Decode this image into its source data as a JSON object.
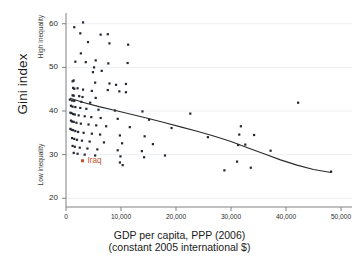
{
  "chart_data": {
    "type": "scatter",
    "title": "",
    "xlabel": "GDP per capita, PPP (2006)",
    "xlabel_line2": "(constant 2005 international $)",
    "ylabel": "Gini index",
    "xlim": [
      0,
      52000
    ],
    "ylim": [
      18,
      62
    ],
    "xticks": [
      0,
      10000,
      20000,
      30000,
      40000,
      50000
    ],
    "xtick_labels": [
      "0",
      "10,000",
      "20,000",
      "30,000",
      "40,000",
      "50,000"
    ],
    "yticks": [
      20,
      30,
      40,
      50,
      60
    ],
    "ytick_labels": [
      "20",
      "30",
      "40",
      "50",
      "60"
    ],
    "grid": "horizontal-faint",
    "legend": "none",
    "annotations": [
      {
        "text": "High inequality",
        "axis": "y",
        "position": "upper",
        "rotation": -90
      },
      {
        "text": "Low inequality",
        "axis": "y",
        "position": "lower",
        "rotation": -90
      }
    ],
    "colors": {
      "point": "#22262e",
      "highlight": "#c0542c",
      "trendline": "#2a2a2a",
      "grid": "#eceff2",
      "axis": "#808080",
      "background": "#ffffff"
    },
    "series": [
      {
        "name": "Countries",
        "marker": "square",
        "color": "#22262e",
        "points": [
          [
            1500,
            59.2
          ],
          [
            3100,
            60.3
          ],
          [
            2600,
            57.8
          ],
          [
            6300,
            57.5
          ],
          [
            4000,
            55.8
          ],
          [
            7600,
            57.6
          ],
          [
            7900,
            55.5
          ],
          [
            11300,
            55.2
          ],
          [
            2700,
            53.2
          ],
          [
            1700,
            51.3
          ],
          [
            3600,
            51.2
          ],
          [
            5400,
            51.6
          ],
          [
            5100,
            50.0
          ],
          [
            6500,
            49.2
          ],
          [
            4900,
            48.9
          ],
          [
            11200,
            51.0
          ],
          [
            7700,
            50.9
          ],
          [
            1400,
            47.0
          ],
          [
            1200,
            46.8
          ],
          [
            5300,
            46.5
          ],
          [
            7900,
            46.3
          ],
          [
            9100,
            46.0
          ],
          [
            10900,
            46.2
          ],
          [
            1300,
            45.3
          ],
          [
            1500,
            45.1
          ],
          [
            2100,
            45.2
          ],
          [
            3100,
            44.9
          ],
          [
            4700,
            44.6
          ],
          [
            7600,
            44.8
          ],
          [
            9700,
            44.5
          ],
          [
            10900,
            44.3
          ],
          [
            1200,
            43.6
          ],
          [
            1400,
            43.5
          ],
          [
            2400,
            43.4
          ],
          [
            3000,
            43.2
          ],
          [
            5400,
            43.0
          ],
          [
            700,
            42.6
          ],
          [
            1100,
            42.4
          ],
          [
            1500,
            42.3
          ],
          [
            2800,
            42.1
          ],
          [
            4400,
            41.9
          ],
          [
            900,
            41.2
          ],
          [
            1200,
            41.0
          ],
          [
            1700,
            40.9
          ],
          [
            2600,
            40.7
          ],
          [
            3700,
            40.5
          ],
          [
            5900,
            40.3
          ],
          [
            8900,
            40.1
          ],
          [
            13900,
            39.9
          ],
          [
            22600,
            39.4
          ],
          [
            800,
            39.6
          ],
          [
            1000,
            39.5
          ],
          [
            1300,
            39.3
          ],
          [
            1600,
            39.2
          ],
          [
            2300,
            39.0
          ],
          [
            3400,
            38.8
          ],
          [
            4600,
            38.6
          ],
          [
            6300,
            38.4
          ],
          [
            9400,
            38.2
          ],
          [
            15100,
            38.0
          ],
          [
            900,
            37.8
          ],
          [
            1100,
            37.6
          ],
          [
            1400,
            37.5
          ],
          [
            1900,
            37.3
          ],
          [
            2700,
            37.1
          ],
          [
            4100,
            36.9
          ],
          [
            5500,
            36.7
          ],
          [
            7300,
            36.5
          ],
          [
            11600,
            36.3
          ],
          [
            19200,
            36.1
          ],
          [
            31800,
            36.5
          ],
          [
            800,
            35.9
          ],
          [
            1000,
            35.7
          ],
          [
            1300,
            35.6
          ],
          [
            1700,
            35.4
          ],
          [
            2200,
            35.2
          ],
          [
            3200,
            35.0
          ],
          [
            4700,
            34.8
          ],
          [
            6200,
            34.6
          ],
          [
            9800,
            34.4
          ],
          [
            14300,
            34.2
          ],
          [
            25800,
            34.0
          ],
          [
            31500,
            34.6
          ],
          [
            34200,
            34.5
          ],
          [
            1100,
            33.8
          ],
          [
            1500,
            33.6
          ],
          [
            2000,
            33.4
          ],
          [
            2900,
            33.2
          ],
          [
            4300,
            33.0
          ],
          [
            6900,
            32.8
          ],
          [
            10200,
            32.6
          ],
          [
            15800,
            32.4
          ],
          [
            32600,
            32.3
          ],
          [
            1200,
            32.0
          ],
          [
            1600,
            31.8
          ],
          [
            2500,
            31.6
          ],
          [
            3900,
            31.4
          ],
          [
            5700,
            31.2
          ],
          [
            9400,
            31.0
          ],
          [
            13800,
            30.8
          ],
          [
            37200,
            30.9
          ],
          [
            1400,
            30.4
          ],
          [
            2100,
            30.2
          ],
          [
            3400,
            30.0
          ],
          [
            5300,
            29.8
          ],
          [
            9900,
            29.6
          ],
          [
            14200,
            29.4
          ],
          [
            18000,
            29.8
          ],
          [
            31100,
            28.4
          ],
          [
            9800,
            28.2
          ],
          [
            10300,
            27.6
          ],
          [
            33600,
            27.0
          ],
          [
            28800,
            26.4
          ],
          [
            48200,
            26.1
          ],
          [
            42200,
            41.9
          ],
          [
            31300,
            32.2
          ]
        ]
      },
      {
        "name": "Iraq",
        "marker": "square",
        "color": "#c0542c",
        "label": "Iraq",
        "points": [
          [
            3000,
            28.6
          ]
        ]
      }
    ],
    "trendline": {
      "type": "fitted-curve",
      "color": "#2a2a2a",
      "points": [
        [
          800,
          42.9
        ],
        [
          3000,
          42.0
        ],
        [
          6000,
          41.0
        ],
        [
          9000,
          40.1
        ],
        [
          12000,
          39.2
        ],
        [
          15000,
          38.3
        ],
        [
          18000,
          37.3
        ],
        [
          21000,
          36.3
        ],
        [
          24000,
          35.3
        ],
        [
          27000,
          34.2
        ],
        [
          30000,
          33.0
        ],
        [
          33000,
          31.6
        ],
        [
          36000,
          30.2
        ],
        [
          39000,
          28.8
        ],
        [
          42000,
          27.6
        ],
        [
          45000,
          26.6
        ],
        [
          48200,
          25.9
        ]
      ]
    }
  }
}
